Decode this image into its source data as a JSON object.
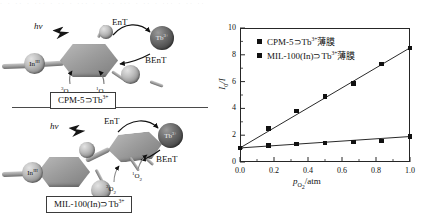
{
  "figure": {
    "scan_artifact_top": "· · ·· · ··· · ·· · ··· · · ·· ··· · ·· · ··· · ·· ··"
  },
  "schemes": [
    {
      "id": "cpm5",
      "caption": "CPM-5⊃Tb",
      "caption_sup": "3+",
      "excitation_label": "hν",
      "energy_transfer_label": "EnT",
      "back_energy_transfer_label": "BEnT",
      "metal_node_label": "In",
      "metal_node_sup": "III",
      "lanthanide_label": "Tb",
      "lanthanide_sup": "3+",
      "oxygen_triplet": "O",
      "oxygen_triplet_pre": "3",
      "oxygen_triplet_sub": "2",
      "oxygen_singlet": "O",
      "oxygen_singlet_pre": "1",
      "oxygen_singlet_sub": "2"
    },
    {
      "id": "mil100in",
      "caption": "MIL-100(In)⊃Tb",
      "caption_sup": "3+",
      "excitation_label": "hν",
      "energy_transfer_label": "EnT",
      "back_energy_transfer_label": "BEnT",
      "metal_node_label": "In",
      "metal_node_sup": "III",
      "lanthanide_label": "Tb",
      "lanthanide_sup": "3+",
      "oxygen_triplet": "O",
      "oxygen_triplet_pre": "3",
      "oxygen_triplet_sub": "2",
      "oxygen_singlet": "O",
      "oxygen_singlet_pre": "1",
      "oxygen_singlet_sub": "2"
    }
  ],
  "chart_data": {
    "type": "line",
    "title": "",
    "xlabel_html": "p_O2/atm",
    "xlabel_main": "p",
    "xlabel_sub": "O",
    "xlabel_sub2": "2",
    "xlabel_unit": "/atm",
    "ylabel_main": "I",
    "ylabel_sub": "0",
    "ylabel_tail": "/I",
    "xlim": [
      0.0,
      1.0
    ],
    "ylim": [
      0,
      10
    ],
    "xticks": [
      0.0,
      0.2,
      0.4,
      0.6,
      0.8,
      1.0
    ],
    "xtick_labels": [
      "0.0",
      "0.2",
      "0.4",
      "0.6",
      "0.8",
      "1.0"
    ],
    "yticks": [
      0,
      2,
      4,
      6,
      8,
      10
    ],
    "ytick_labels": [
      "0",
      "2",
      "4",
      "6",
      "8",
      "10"
    ],
    "minor_xticks": [
      0.1,
      0.3,
      0.5,
      0.7,
      0.9
    ],
    "minor_yticks": [
      1,
      3,
      5,
      7,
      9
    ],
    "grid": false,
    "legend_position": "upper-left",
    "x": [
      0.0,
      0.167,
      0.333,
      0.5,
      0.667,
      0.833,
      1.0
    ],
    "series": [
      {
        "name": "CPM-5⊃Tb",
        "name_sup": "3+",
        "name_tail": "薄膜",
        "marker": "square",
        "color": "#111111",
        "values": [
          1.05,
          1.22,
          1.35,
          1.42,
          1.48,
          1.58,
          1.9
        ]
      },
      {
        "name": "MIL-100(In)⊃Tb",
        "name_sup": "3+",
        "name_tail": "薄膜",
        "marker": "square",
        "color": "#111111",
        "values": [
          1.05,
          2.5,
          3.82,
          4.9,
          5.88,
          7.3,
          8.52
        ]
      }
    ]
  }
}
